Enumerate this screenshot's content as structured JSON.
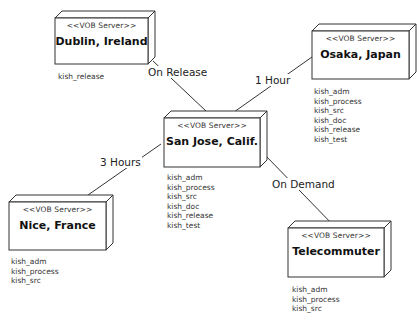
{
  "diagram": {
    "stroke_color": "#333333",
    "background": "#ffffff",
    "nodes": [
      {
        "id": "dublin",
        "stereotype": "<<VOB Server>>",
        "name": "Dublin, Ireland",
        "x": 55,
        "y": 18,
        "w": 93,
        "h": 46,
        "vobs": [
          "kish_release"
        ],
        "vobs_x": 58,
        "vobs_y": 72
      },
      {
        "id": "osaka",
        "stereotype": "<<VOB Server>>",
        "name": "Osaka, Japan",
        "x": 312,
        "y": 31,
        "w": 97,
        "h": 48,
        "vobs": [
          "kish_adm",
          "kish_process",
          "kish_src",
          "kish_doc",
          "kish_release",
          "kish_test"
        ],
        "vobs_x": 314,
        "vobs_y": 87
      },
      {
        "id": "sanjose",
        "stereotype": "<<VOB Server>>",
        "name": "San Jose, Calif.",
        "x": 164,
        "y": 118,
        "w": 96,
        "h": 49,
        "vobs": [
          "kish_adm",
          "kish_process",
          "kish_src",
          "kish_doc",
          "kish_release",
          "kish_test"
        ],
        "vobs_x": 167,
        "vobs_y": 173
      },
      {
        "id": "nice",
        "stereotype": "<<VOB Server>>",
        "name": "Nice, France",
        "x": 9,
        "y": 202,
        "w": 97,
        "h": 48,
        "vobs": [
          "kish_adm",
          "kish_process",
          "kish_src"
        ],
        "vobs_x": 11,
        "vobs_y": 257
      },
      {
        "id": "telecommuter",
        "stereotype": "<<VOB Server>>",
        "name": "Telecommuter",
        "x": 288,
        "y": 228,
        "w": 96,
        "h": 49,
        "vobs": [
          "kish_adm",
          "kish_process",
          "kish_src"
        ],
        "vobs_x": 292,
        "vobs_y": 285
      }
    ],
    "connections": [
      {
        "from": "dublin",
        "to": "sanjose",
        "label": "On Release",
        "points": [
          [
            153,
            61
          ],
          [
            207,
            112
          ]
        ],
        "label_x": 147,
        "label_y": 66
      },
      {
        "from": "osaka",
        "to": "sanjose",
        "label": "1 Hour",
        "points": [
          [
            312,
            57
          ],
          [
            234,
            112
          ]
        ],
        "label_x": 254,
        "label_y": 74
      },
      {
        "from": "sanjose",
        "to": "nice",
        "label": "3 Hours",
        "points": [
          [
            161,
            144
          ],
          [
            78,
            202
          ]
        ],
        "label_x": 99,
        "label_y": 156
      },
      {
        "from": "sanjose",
        "to": "telecommuter",
        "label": "On Demand",
        "points": [
          [
            265,
            155
          ],
          [
            336,
            228
          ]
        ],
        "label_x": 271,
        "label_y": 178
      }
    ],
    "depth": 7
  }
}
